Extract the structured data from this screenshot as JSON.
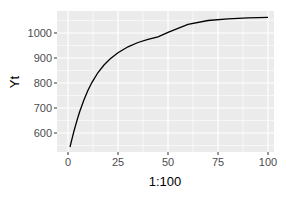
{
  "chart_data": {
    "type": "line",
    "title": "",
    "xlabel": "1:100",
    "ylabel": "Yt",
    "xlim": [
      -3.5,
      104
    ],
    "ylim": [
      520,
      1090
    ],
    "x_ticks": [
      0,
      25,
      50,
      75,
      100
    ],
    "y_ticks": [
      600,
      700,
      800,
      900,
      1000
    ],
    "grid": true,
    "legend": null,
    "series": [
      {
        "name": "Yt",
        "color": "#000000",
        "x": [
          1,
          2,
          3,
          4,
          5,
          6,
          8,
          10,
          12,
          15,
          18,
          21,
          25,
          30,
          35,
          40,
          45,
          50,
          60,
          70,
          80,
          90,
          100
        ],
        "y": [
          544,
          577,
          608,
          637,
          664,
          689,
          733,
          771,
          803,
          842,
          872,
          896,
          921,
          945,
          962,
          975,
          985,
          1003,
          1035,
          1050,
          1057,
          1061,
          1063
        ]
      }
    ]
  },
  "panel_bg": "#ebebeb",
  "grid_color": "#ffffff"
}
